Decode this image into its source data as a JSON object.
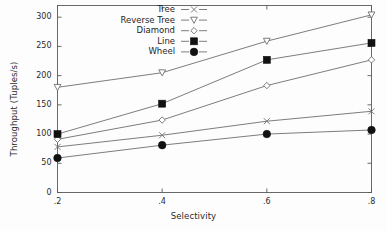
{
  "chart_data": {
    "type": "line",
    "title": "",
    "subtitle": "",
    "xlabel": "Selectivity",
    "ylabel": "Throughput (Tuples/s)",
    "x": [
      0.2,
      0.4,
      0.6,
      0.8
    ],
    "xtick_labels": [
      ".2",
      ".4",
      ".6",
      ".8"
    ],
    "ytick_labels": [
      "0",
      "50",
      "100",
      "150",
      "200",
      "250",
      "300"
    ],
    "ytick_values": [
      0,
      50,
      100,
      150,
      200,
      250,
      300
    ],
    "xlim": [
      0.2,
      0.8
    ],
    "ylim": [
      0,
      320
    ],
    "grid": false,
    "legend_position": "top-left-inside",
    "series": [
      {
        "name": "Tree",
        "marker": "x-cross",
        "values": [
          78,
          98,
          122,
          139
        ]
      },
      {
        "name": "Reverse Tree",
        "marker": "triangle-down-open",
        "values": [
          180,
          205,
          259,
          304
        ]
      },
      {
        "name": "Diamond",
        "marker": "diamond-open",
        "values": [
          91,
          124,
          183,
          227
        ]
      },
      {
        "name": "Line",
        "marker": "square-filled",
        "values": [
          100,
          152,
          227,
          256
        ]
      },
      {
        "name": "Wheel",
        "marker": "circle-filled",
        "values": [
          59,
          81,
          100,
          107
        ]
      }
    ]
  },
  "colors": {
    "line": "#6e6e6e",
    "marker_open": "#6e6e6e",
    "marker_fill": "#111111",
    "axis": "#5a5a5a",
    "text": "#2b2b2b",
    "background": "#fdfdfd"
  }
}
